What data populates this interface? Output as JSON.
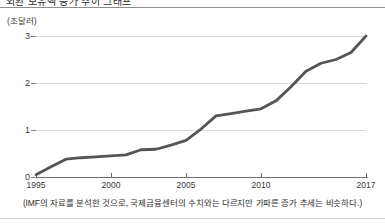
{
  "page": {
    "cropped_header_text": "외환 보유액 증가 추이 그래프",
    "caption": "(IMF의 자료를 분석한 것으로, 국제금융센터의 수치와는 다르지만 가파른 증가 추세는 비슷하다.)"
  },
  "colors": {
    "line": "#555555",
    "gridline": "#d8d8d8",
    "axis": "#6e6e6e",
    "text": "#3a3a3a",
    "background": "#ffffff"
  },
  "chart_data": {
    "type": "line",
    "title": "",
    "subtitle": "",
    "xlabel": "",
    "ylabel": "(조달러)",
    "unit_label": "(조달러)",
    "xlim": [
      1995,
      2017
    ],
    "ylim": [
      0,
      3
    ],
    "xticks": [
      1995,
      2000,
      2005,
      2010,
      2017
    ],
    "xtick_labels": [
      "1995",
      "2000",
      "2005",
      "2010",
      "2017"
    ],
    "yticks": [
      0,
      1,
      2,
      3
    ],
    "ytick_labels": [
      "0",
      "1",
      "2",
      "3"
    ],
    "grid": true,
    "grid_axis": "y",
    "legend": false,
    "legend_position": "none",
    "x": [
      1995,
      1996,
      1997,
      1998,
      1999,
      2000,
      2001,
      2002,
      2003,
      2004,
      2005,
      2006,
      2007,
      2008,
      2009,
      2010,
      2011,
      2012,
      2013,
      2014,
      2015,
      2016,
      2017
    ],
    "values": [
      0.05,
      0.22,
      0.38,
      0.41,
      0.43,
      0.45,
      0.47,
      0.58,
      0.59,
      0.68,
      0.78,
      1.02,
      1.3,
      1.35,
      1.4,
      1.45,
      1.62,
      1.92,
      2.25,
      2.42,
      2.5,
      2.65,
      3.0
    ],
    "series": [
      {
        "name": "외환보유액",
        "color": "#555555",
        "values": [
          0.05,
          0.22,
          0.38,
          0.41,
          0.43,
          0.45,
          0.47,
          0.58,
          0.59,
          0.68,
          0.78,
          1.02,
          1.3,
          1.35,
          1.4,
          1.45,
          1.62,
          1.92,
          2.25,
          2.42,
          2.5,
          2.65,
          3.0
        ]
      }
    ],
    "annotations": []
  }
}
